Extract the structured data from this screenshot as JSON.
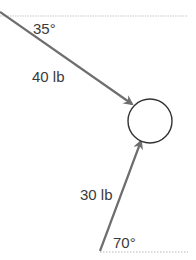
{
  "diagram": {
    "object": {
      "shape": "circle",
      "cx": 150,
      "cy": 121,
      "r": 22
    },
    "forces": [
      {
        "magnitude_label": "40 lb",
        "angle_label": "35°",
        "angle_deg": 35,
        "reference": "horizontal above",
        "direction": "down-right toward object"
      },
      {
        "magnitude_label": "30 lb",
        "angle_label": "70°",
        "angle_deg": 70,
        "reference": "horizontal below",
        "direction": "up-right toward object"
      }
    ],
    "colors": {
      "arrow": "#6e6e6e",
      "text": "#3a3a3a",
      "reference_line": "#c8c8c8",
      "circle": "#333333"
    }
  }
}
